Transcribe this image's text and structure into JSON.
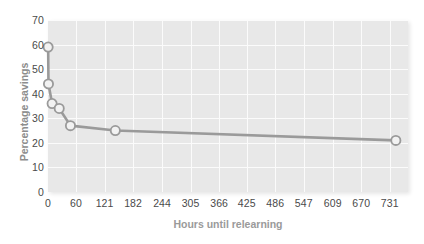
{
  "chart": {
    "type": "line",
    "title": "",
    "xlabel": "Hours until relearning",
    "ylabel": "Percentage savings",
    "xticks": [
      "0",
      "60",
      "121",
      "182",
      "244",
      "305",
      "366",
      "425",
      "486",
      "547",
      "609",
      "670",
      "731"
    ],
    "yticks": [
      "0",
      "10",
      "20",
      "30",
      "40",
      "50",
      "60",
      "70"
    ],
    "xtick_values": [
      0,
      60,
      121,
      182,
      244,
      305,
      366,
      425,
      486,
      547,
      609,
      670,
      731
    ],
    "ytick_values": [
      0,
      10,
      20,
      30,
      40,
      50,
      60,
      70
    ]
  },
  "chart_data": {
    "type": "line",
    "title": "",
    "xlabel": "Hours until relearning",
    "ylabel": "Percentage savings",
    "xlim": [
      0,
      770
    ],
    "ylim": [
      0,
      70
    ],
    "grid": true,
    "legend": false,
    "marker": "circle-open",
    "line_color": "#9a9a9a",
    "marker_face_color": "#f2f2f2",
    "marker_edge_color": "#9a9a9a",
    "plot_bg_color": "#e8e8e8",
    "x": [
      0.33,
      1,
      8.8,
      24,
      48,
      144,
      744
    ],
    "y": [
      59,
      44,
      36,
      34,
      27,
      25,
      21
    ],
    "points": [
      {
        "x": 0.33,
        "y": 59
      },
      {
        "x": 1,
        "y": 44
      },
      {
        "x": 8.8,
        "y": 36
      },
      {
        "x": 24,
        "y": 34
      },
      {
        "x": 48,
        "y": 27
      },
      {
        "x": 144,
        "y": 25
      },
      {
        "x": 744,
        "y": 21
      }
    ],
    "xticks": [
      0,
      60,
      121,
      182,
      244,
      305,
      366,
      425,
      486,
      547,
      609,
      670,
      731
    ],
    "xticklabels": [
      "0",
      "60",
      "121",
      "182",
      "244",
      "305",
      "366",
      "425",
      "486",
      "547",
      "609",
      "670",
      "731"
    ],
    "yticks": [
      0,
      10,
      20,
      30,
      40,
      50,
      60,
      70
    ],
    "yticklabels": [
      "0",
      "10",
      "20",
      "30",
      "40",
      "50",
      "60",
      "70"
    ]
  }
}
